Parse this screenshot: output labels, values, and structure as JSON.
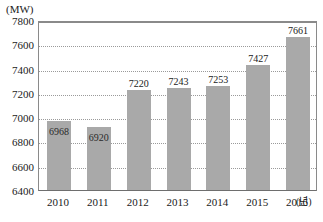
{
  "chart_data": {
    "type": "bar",
    "title": "",
    "subtitle": "",
    "xlabel": "(년)",
    "ylabel": "(MW)",
    "categories": [
      "2010",
      "2011",
      "2012",
      "2013",
      "2014",
      "2015",
      "2016"
    ],
    "values": [
      6968,
      6920,
      7220,
      7243,
      7253,
      7427,
      7661
    ],
    "value_labels": [
      "6968",
      "6920",
      "7220",
      "7243",
      "7253",
      "7427",
      "7661"
    ],
    "label_placement": [
      "inside",
      "inside",
      "above",
      "above",
      "above",
      "above",
      "above"
    ],
    "ylim": [
      6400,
      7800
    ],
    "y_ticks": [
      7800,
      7600,
      7400,
      7200,
      7000,
      6800,
      6600,
      6400
    ],
    "y_tick_labels": [
      "7800",
      "7600",
      "7400",
      "7200",
      "7000",
      "6800",
      "6600",
      "6400"
    ],
    "grid": true,
    "grid_style": "dotted",
    "legend": null,
    "bar_color": "#a9a9a9",
    "axis_color": "#8a8a8a",
    "grid_color": "#9a9a9a",
    "text_color": "#1a1a1a"
  }
}
